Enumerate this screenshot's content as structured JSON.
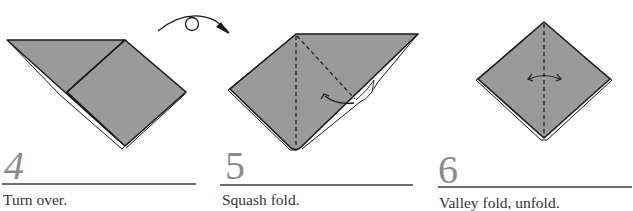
{
  "colors": {
    "paper": "#9a9a9a",
    "outline": "#1a1a1a",
    "number": "#8a8a8a",
    "rule": "#6e6e6e",
    "caption": "#333333"
  },
  "turn_over_symbol": {
    "icon": "turn-over-arrow-icon",
    "description": "curved arrow with loop"
  },
  "steps": [
    {
      "number": "4",
      "caption": "Turn over.",
      "arrows": []
    },
    {
      "number": "5",
      "caption": "Squash fold.",
      "arrows": [
        "curved-fold-arrow"
      ],
      "fold_lines": [
        "vertical-valley-dashed",
        "diagonal-valley-dashed"
      ]
    },
    {
      "number": "6",
      "caption": "Valley fold, unfold.",
      "arrows": [
        "double-headed-fold-unfold-arrow"
      ],
      "fold_lines": [
        "vertical-valley-dashed"
      ]
    }
  ]
}
